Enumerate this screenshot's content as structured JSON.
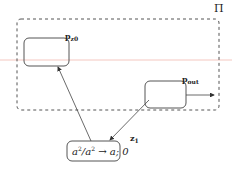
{
  "diagram": {
    "outer_label": "Π",
    "nodes": [
      {
        "id": "z0",
        "name": "p",
        "subscript": "z0",
        "label": "p_z0"
      },
      {
        "id": "out",
        "name": "p",
        "subscript": "out",
        "label": "p_out"
      },
      {
        "id": "z1",
        "name": "z",
        "subscript": "1",
        "label": "z_1",
        "rule": {
          "lhs_base": "a",
          "lhs_exp": "2",
          "slash": "/",
          "mid_base": "a",
          "mid_exp": "2",
          "arrow": "→",
          "rhs": "a; 0"
        }
      }
    ],
    "edges": [
      {
        "from": "z1",
        "to": "z0"
      },
      {
        "from": "out",
        "to": "z1"
      },
      {
        "from": "out",
        "to": "environment"
      }
    ],
    "colors": {
      "stroke": "#444444",
      "dash": "#555555",
      "faint_line": "#f4c7c0"
    }
  }
}
